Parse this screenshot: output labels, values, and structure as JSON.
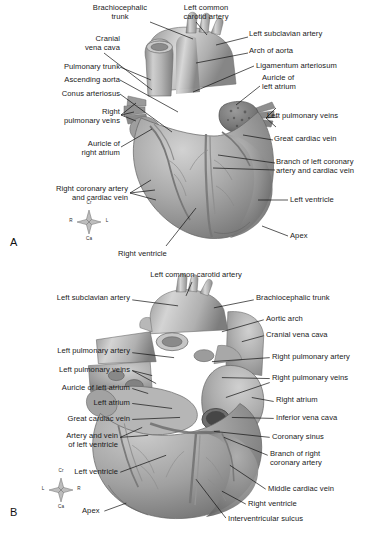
{
  "figure": {
    "background": "#ffffff",
    "text_color": "#1a1a1a",
    "leader_color": "#111111"
  },
  "panel_a": {
    "letter": "A",
    "view": "auricular (left) surface of the heart",
    "compass": {
      "top": "Cr",
      "left": "R",
      "right": "L",
      "bottom": "Ca"
    },
    "labels": [
      {
        "id": "brachiocephalic-trunk",
        "text": "Brachiocephalic\ntrunk",
        "align": "center",
        "x": 80,
        "y": 4,
        "w": 80
      },
      {
        "id": "left-common-carotid",
        "text": "Left common\ncarotid artery",
        "align": "center",
        "x": 166,
        "y": 4,
        "w": 80
      },
      {
        "id": "cranial-vena-cava",
        "text": "Cranial\nvena cava",
        "align": "right",
        "x": 20,
        "y": 35,
        "w": 100
      },
      {
        "id": "left-subclavian-artery",
        "text": "Left subclavian artery",
        "align": "left",
        "x": 249,
        "y": 30,
        "w": 130
      },
      {
        "id": "arch-of-aorta",
        "text": "Arch of aorta",
        "align": "left",
        "x": 249,
        "y": 47,
        "w": 130
      },
      {
        "id": "pulmonary-trunk",
        "text": "Pulmonary trunk",
        "align": "right",
        "x": 20,
        "y": 63,
        "w": 100
      },
      {
        "id": "ligamentum-arteriosum",
        "text": "Ligamentum arteriosum",
        "align": "left",
        "x": 256,
        "y": 62,
        "w": 134
      },
      {
        "id": "ascending-aorta",
        "text": "Ascending aorta",
        "align": "right",
        "x": 20,
        "y": 76,
        "w": 100
      },
      {
        "id": "auricle-of-left-atrium",
        "text": "Auricle of\nleft atrium",
        "align": "left",
        "x": 262,
        "y": 74,
        "w": 110
      },
      {
        "id": "conus-arteriosus",
        "text": "Conus arteriosus",
        "align": "right",
        "x": 20,
        "y": 90,
        "w": 100
      },
      {
        "id": "right-pulmonary-veins",
        "text": "Right\npulmonary veins",
        "align": "right",
        "x": 4,
        "y": 108,
        "w": 116
      },
      {
        "id": "left-pulmonary-veins",
        "text": "Left pulmonary veins",
        "align": "left",
        "x": 267,
        "y": 112,
        "w": 122
      },
      {
        "id": "great-cardiac-vein",
        "text": "Great cardiac vein",
        "align": "left",
        "x": 274,
        "y": 135,
        "w": 116
      },
      {
        "id": "auricle-of-right-atrium",
        "text": "Auricle of\nright atrium",
        "align": "right",
        "x": 16,
        "y": 140,
        "w": 104
      },
      {
        "id": "branch-left-coronary",
        "text": "Branch of left coronary\nartery and cardiac vein",
        "align": "left",
        "x": 276,
        "y": 158,
        "w": 114
      },
      {
        "id": "right-coronary-artery",
        "text": "Right coronary artery\nand cardiac vein",
        "align": "right",
        "x": 4,
        "y": 185,
        "w": 124
      },
      {
        "id": "left-ventricle",
        "text": "Left ventricle",
        "align": "left",
        "x": 290,
        "y": 196,
        "w": 100
      },
      {
        "id": "apex",
        "text": "Apex",
        "align": "left",
        "x": 290,
        "y": 232,
        "w": 60
      },
      {
        "id": "right-ventricle",
        "text": "Right ventricle",
        "align": "left",
        "x": 118,
        "y": 250,
        "w": 90
      }
    ]
  },
  "panel_b": {
    "letter": "B",
    "view": "atrial (right/diaphragmatic) surface of the heart",
    "compass": {
      "top": "Cr",
      "left": "L",
      "right": "R",
      "bottom": "Ca"
    },
    "labels": [
      {
        "id": "left-common-carotid-b",
        "text": "Left common carotid artery",
        "align": "center",
        "x": 120,
        "y": 5,
        "w": 152
      },
      {
        "id": "left-subclavian-b",
        "text": "Left subclavian artery",
        "align": "right",
        "x": 10,
        "y": 28,
        "w": 120
      },
      {
        "id": "brachiocephalic-trunk-b",
        "text": "Brachiocephalic trunk",
        "align": "left",
        "x": 256,
        "y": 28,
        "w": 132
      },
      {
        "id": "aortic-arch",
        "text": "Aortic arch",
        "align": "left",
        "x": 266,
        "y": 49,
        "w": 110
      },
      {
        "id": "cranial-vena-cava-b",
        "text": "Cranial vena cava",
        "align": "left",
        "x": 266,
        "y": 65,
        "w": 120
      },
      {
        "id": "left-pulmonary-artery",
        "text": "Left pulmonary artery",
        "align": "right",
        "x": 10,
        "y": 81,
        "w": 120
      },
      {
        "id": "right-pulmonary-artery",
        "text": "Right pulmonary artery",
        "align": "left",
        "x": 272,
        "y": 87,
        "w": 118
      },
      {
        "id": "left-pulmonary-veins-b",
        "text": "Left pulmonary veins",
        "align": "right",
        "x": 10,
        "y": 100,
        "w": 120
      },
      {
        "id": "right-pulmonary-veins-b",
        "text": "Right pulmonary veins",
        "align": "left",
        "x": 272,
        "y": 108,
        "w": 118
      },
      {
        "id": "auricle-left-atrium-b",
        "text": "Auricle of left atrium",
        "align": "right",
        "x": 10,
        "y": 118,
        "w": 120
      },
      {
        "id": "left-atrium",
        "text": "Left atrium",
        "align": "right",
        "x": 30,
        "y": 133,
        "w": 100
      },
      {
        "id": "right-atrium",
        "text": "Right atrium",
        "align": "left",
        "x": 276,
        "y": 130,
        "w": 110
      },
      {
        "id": "great-cardiac-vein-b",
        "text": "Great cardiac vein",
        "align": "right",
        "x": 10,
        "y": 149,
        "w": 120
      },
      {
        "id": "inferior-vena-cava",
        "text": "Inferior vena cava",
        "align": "left",
        "x": 276,
        "y": 148,
        "w": 112
      },
      {
        "id": "coronary-sinus",
        "text": "Coronary sinus",
        "align": "left",
        "x": 272,
        "y": 167,
        "w": 112
      },
      {
        "id": "artery-vein-left-vent",
        "text": "Artery and vein\nof left ventricle",
        "align": "right",
        "x": 10,
        "y": 166,
        "w": 108
      },
      {
        "id": "branch-right-coronary",
        "text": "Branch of right\ncoronary artery",
        "align": "left",
        "x": 270,
        "y": 184,
        "w": 116
      },
      {
        "id": "left-ventricle-b",
        "text": "Left ventricle",
        "align": "right",
        "x": 30,
        "y": 202,
        "w": 88
      },
      {
        "id": "middle-cardiac-vein",
        "text": "Middle cardiac vein",
        "align": "left",
        "x": 268,
        "y": 219,
        "w": 120
      },
      {
        "id": "right-ventricle-b",
        "text": "Right ventricle",
        "align": "left",
        "x": 248,
        "y": 234,
        "w": 110
      },
      {
        "id": "apex-b",
        "text": "Apex",
        "align": "left",
        "x": 82,
        "y": 241,
        "w": 50
      },
      {
        "id": "interventricular-sulcus",
        "text": "Interventricular sulcus",
        "align": "left",
        "x": 228,
        "y": 249,
        "w": 140
      }
    ]
  }
}
